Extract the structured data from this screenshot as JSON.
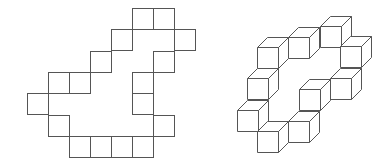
{
  "figure": {
    "stroke_color": "#555555",
    "background": "#ffffff",
    "left_grid": {
      "description": "Flat polyomino outline (square grid)",
      "origin_x": 27,
      "origin_y": 8,
      "cell_w": 21,
      "cell_h": 21.3,
      "cells": [
        [
          5,
          0
        ],
        [
          6,
          0
        ],
        [
          4,
          1
        ],
        [
          7,
          1
        ],
        [
          3,
          2
        ],
        [
          6,
          2
        ],
        [
          1,
          3
        ],
        [
          2,
          3
        ],
        [
          5,
          3
        ],
        [
          0,
          4
        ],
        [
          5,
          4
        ],
        [
          1,
          5
        ],
        [
          6,
          5
        ],
        [
          2,
          6
        ],
        [
          3,
          6
        ],
        [
          4,
          6
        ],
        [
          5,
          6
        ]
      ]
    },
    "right_cubes": {
      "description": "Oblique-projection ring of unit cubes",
      "size": 21,
      "depth_dx": 10,
      "depth_dy": -10,
      "cubes": [
        [
          320,
          26
        ],
        [
          340,
          46
        ],
        [
          288,
          37
        ],
        [
          330,
          78
        ],
        [
          257,
          47
        ],
        [
          299,
          89
        ],
        [
          247,
          78
        ],
        [
          288,
          121
        ],
        [
          237,
          110
        ],
        [
          257,
          131
        ]
      ]
    }
  }
}
